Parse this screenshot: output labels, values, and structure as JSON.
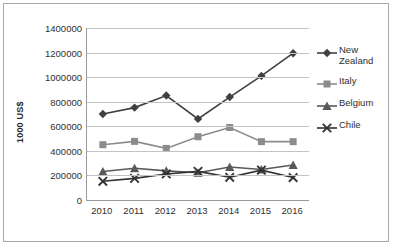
{
  "chart_data": {
    "type": "line",
    "title": "",
    "xlabel": "",
    "ylabel": "1000 US$",
    "categories": [
      "2010",
      "2011",
      "2012",
      "2013",
      "2014",
      "2015",
      "2016"
    ],
    "ylim": [
      0,
      1400000
    ],
    "ytick_values": [
      0,
      200000,
      400000,
      600000,
      800000,
      1000000,
      1200000,
      1400000
    ],
    "ytick_labels": [
      "0",
      "200000",
      "400000",
      "600000",
      "800000",
      "1000000",
      "1200000",
      "1400000"
    ],
    "grid": true,
    "legend_position": "right",
    "series": [
      {
        "name": "New Zealand",
        "marker": "diamond",
        "color": "#404040",
        "values": [
          700000,
          752000,
          850000,
          660000,
          838000,
          1010000,
          1195000
        ]
      },
      {
        "name": "Italy",
        "marker": "square",
        "color": "#8c8c8c",
        "values": [
          450000,
          477000,
          420000,
          515000,
          590000,
          475000,
          475000
        ]
      },
      {
        "name": "Belgium",
        "marker": "triangle",
        "color": "#595959",
        "values": [
          232000,
          258000,
          237000,
          222000,
          268000,
          248000,
          285000
        ]
      },
      {
        "name": "Chile",
        "marker": "x",
        "color": "#333333",
        "values": [
          152000,
          176000,
          212000,
          233000,
          185000,
          243000,
          183000
        ]
      }
    ]
  },
  "axis": {
    "y_title": "1000 US$"
  },
  "legend": {
    "items": [
      {
        "label": "New Zealand"
      },
      {
        "label": "Italy"
      },
      {
        "label": "Belgium"
      },
      {
        "label": "Chile"
      }
    ]
  },
  "colors": {
    "frame_border": "#a8a8a8",
    "gridline": "#c3c3c3",
    "axis_line": "#9a9a9a",
    "text": "#2f2f2f"
  }
}
